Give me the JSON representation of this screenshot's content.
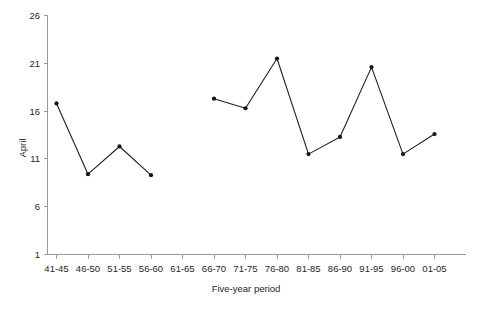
{
  "chart_data": {
    "type": "line",
    "title": "",
    "xlabel": "Five-year period",
    "ylabel": "April",
    "categories": [
      "41-45",
      "46-50",
      "51-55",
      "56-60",
      "61-65",
      "66-70",
      "71-75",
      "76-80",
      "81-85",
      "86-90",
      "91-95",
      "96-00",
      "01-05"
    ],
    "values": [
      16.8,
      9.4,
      12.3,
      9.3,
      null,
      17.3,
      16.3,
      21.5,
      11.5,
      13.3,
      20.6,
      11.5,
      13.6
    ],
    "series": [
      {
        "name": "April",
        "values": [
          16.8,
          9.4,
          12.3,
          9.3,
          null,
          17.3,
          16.3,
          21.5,
          11.5,
          13.3,
          20.6,
          11.5,
          13.6
        ]
      }
    ],
    "ylim": [
      1,
      26
    ],
    "yticks": [
      1,
      6,
      11,
      16,
      21,
      26
    ],
    "ytick_labels": [
      "1",
      "6",
      "11",
      "16",
      "21",
      "26"
    ],
    "xtick_labels": [
      "41-45",
      "46-50",
      "51-55",
      "56-60",
      "61-65",
      "66-70",
      "71-75",
      "76-80",
      "81-85",
      "86-90",
      "91-95",
      "96-00",
      "01-05"
    ],
    "grid": false,
    "legend": false,
    "legend_position": "none",
    "marker": "filled-circle",
    "line_color": "#1f1f1f",
    "marker_color": "#141414",
    "axis_color": "#9a9a9a",
    "background_color": "#ffffff",
    "note": "No data point for the 61-65 period; the line is broken across that gap."
  },
  "axes": {
    "y_axis_title": "April",
    "x_axis_title": "Five-year period"
  }
}
